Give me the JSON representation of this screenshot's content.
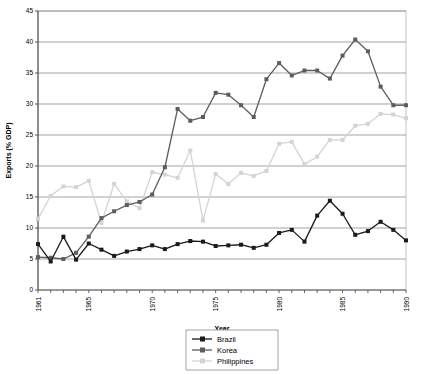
{
  "chart_data": {
    "type": "line",
    "title": "",
    "xlabel": "Year",
    "ylabel": "Exports (% GDP)",
    "xlim": [
      1961,
      1990
    ],
    "ylim": [
      0,
      45
    ],
    "ytick_step": 5,
    "yticks": [
      0,
      5,
      10,
      15,
      20,
      25,
      30,
      35,
      40,
      45
    ],
    "ytick_labels": [
      "0",
      "5",
      "10",
      "15",
      "20",
      "25",
      "30",
      "35",
      "40",
      "45"
    ],
    "xticks_labeled": [
      1961,
      1965,
      1970,
      1975,
      1980,
      1985,
      1990
    ],
    "xtick_labels": [
      "1961",
      "1965",
      "1970",
      "1975",
      "1980",
      "1985",
      "1990"
    ],
    "x": [
      1961,
      1962,
      1963,
      1964,
      1965,
      1966,
      1967,
      1968,
      1969,
      1970,
      1971,
      1972,
      1973,
      1974,
      1975,
      1976,
      1977,
      1978,
      1979,
      1980,
      1981,
      1982,
      1983,
      1984,
      1985,
      1986,
      1987,
      1988,
      1989,
      1990
    ],
    "grid": true,
    "grid_axis": "y",
    "legend_position": "bottom",
    "marker": "square",
    "series": [
      {
        "name": "Brazil",
        "color": "#1a1a1a",
        "values": [
          7.4,
          4.6,
          8.6,
          4.9,
          7.5,
          6.5,
          5.5,
          6.2,
          6.6,
          7.2,
          6.6,
          7.4,
          7.9,
          7.8,
          7.1,
          7.2,
          7.3,
          6.8,
          7.3,
          9.2,
          9.7,
          7.8,
          12.0,
          14.4,
          12.3,
          8.9,
          9.5,
          11.0,
          9.7,
          8.0
        ]
      },
      {
        "name": "Korea",
        "color": "#5d5d5d",
        "values": [
          5.3,
          5.2,
          5.0,
          6.0,
          8.6,
          11.6,
          12.7,
          13.7,
          14.2,
          15.4,
          19.8,
          29.2,
          27.3,
          27.9,
          31.8,
          31.5,
          29.8,
          27.9,
          34.0,
          36.6,
          34.6,
          35.4,
          35.4,
          34.1,
          37.8,
          40.4,
          38.5,
          32.8,
          29.8,
          29.8
        ]
      },
      {
        "name": "Philippines",
        "color": "#d4d4d4",
        "values": [
          11.5,
          15.2,
          16.7,
          16.6,
          17.6,
          10.8,
          17.1,
          14.3,
          13.2,
          19.0,
          18.6,
          18.1,
          22.5,
          11.2,
          18.7,
          17.1,
          18.9,
          18.4,
          19.2,
          23.6,
          23.9,
          20.3,
          21.5,
          24.2,
          24.2,
          26.5,
          26.8,
          28.4,
          28.3,
          27.7
        ]
      }
    ]
  },
  "axes": {
    "ylabel": "Exports (% GDP)",
    "xlabel": "Year"
  },
  "legend": {
    "items": [
      {
        "label": "Brazil"
      },
      {
        "label": "Korea"
      },
      {
        "label": "Philippines"
      }
    ]
  }
}
